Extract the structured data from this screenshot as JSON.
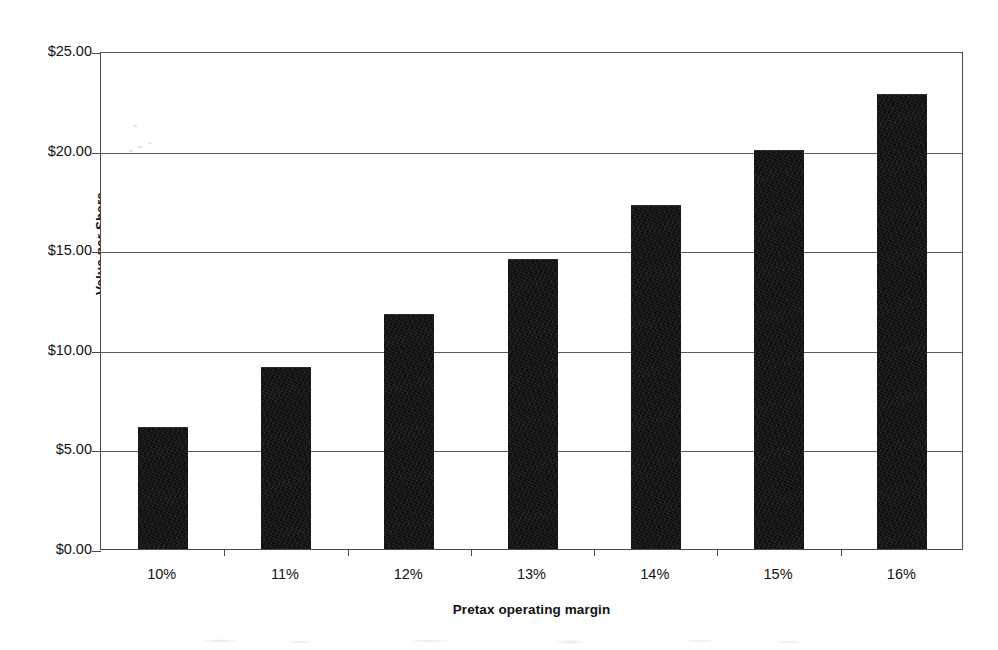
{
  "chart_data": {
    "type": "bar",
    "title": "",
    "subtitle": "",
    "categories": [
      "10%",
      "11%",
      "12%",
      "13%",
      "14%",
      "15%",
      "16%"
    ],
    "values": [
      6.05,
      9.1,
      11.75,
      14.5,
      17.2,
      20.0,
      22.8
    ],
    "xlabel": "Pretax operating margin",
    "ylabel": "Value per Share",
    "ylim": [
      0,
      25
    ],
    "ytick_values": [
      0,
      5,
      10,
      15,
      20,
      25
    ],
    "ytick_labels": [
      "$0.00",
      "$5.00",
      "$10.00",
      "$15.00",
      "$20.00",
      "$25.00"
    ],
    "grid": "horizontal",
    "legend": "none",
    "bar_color": "#100f0f",
    "axis_color": "#4a4a4a",
    "gridline_color": "#5c5c5c",
    "background_color": "#ffffff"
  },
  "axes": {
    "y_title": "Value per Share",
    "x_title": "Pretax operating margin"
  }
}
